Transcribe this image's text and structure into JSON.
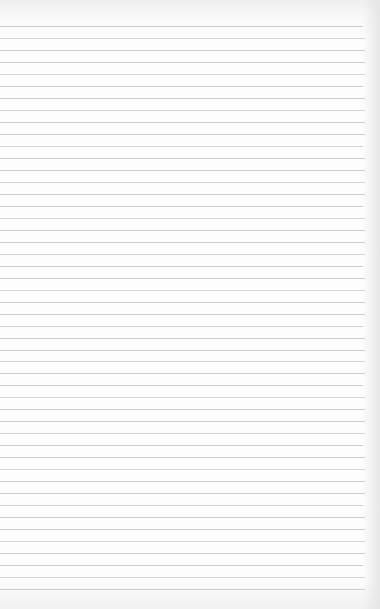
{
  "paper": {
    "type": "ruled-notepad-page",
    "background_color": "#fdfdfd",
    "rule_color": "#cdcdcd",
    "rule_count": 48,
    "first_rule_y": 26,
    "rule_spacing": 12,
    "rule_right_edge_x": 365
  }
}
